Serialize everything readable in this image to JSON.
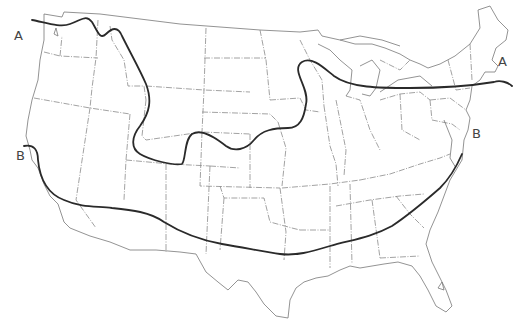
{
  "caption": "· · · ·",
  "labels": {
    "a_west": "A",
    "a_east": "A",
    "b_west": "B",
    "b_east": "B"
  },
  "lines": [
    {
      "name": "A",
      "description": "Northern boundary line from Pacific Northwest across Rockies, dipping through Kansas/Nebraska, rising over Great Lakes to New England"
    },
    {
      "name": "B",
      "description": "Southern boundary line from central California across Southwest, along Gulf states to Virginia"
    }
  ],
  "colors": {
    "line": "#2a2a2a",
    "borders": "#8a8a8a",
    "background": "#ffffff"
  }
}
